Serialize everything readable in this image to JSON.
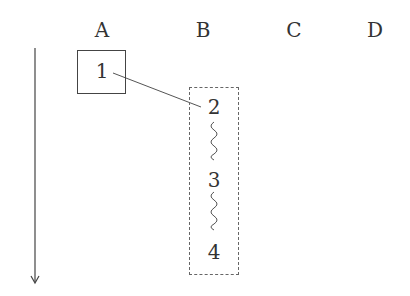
{
  "columns": [
    "A",
    "B",
    "C",
    "D"
  ],
  "nodes": {
    "a1": "1",
    "b2": "2",
    "b3": "3",
    "b4": "4"
  },
  "icons": {
    "arrow": "down-arrow",
    "squiggle": "wavy-connector"
  }
}
